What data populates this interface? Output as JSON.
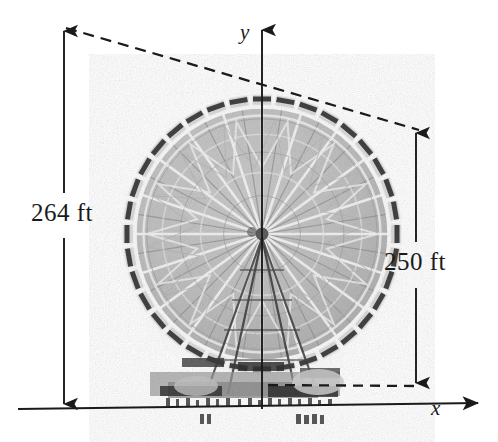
{
  "figure": {
    "kind": "ferris-wheel-dimension-diagram",
    "background_color": "#ffffff",
    "ink_color": "#1a1a1a"
  },
  "axes": {
    "y_label": "y",
    "x_label": "x",
    "y_axis": {
      "x": 262,
      "y_top": 27,
      "y_bottom": 409
    },
    "x_axis": {
      "x_left": 18,
      "x_right": 486,
      "y_left": 409,
      "y_bottom_right": 403
    }
  },
  "dimensions": [
    {
      "id": "overall-height",
      "label": "264 ft",
      "value": 264,
      "unit": "ft",
      "orientation": "vertical",
      "style": "double-headed-arrow",
      "x": 64,
      "y_top": 28,
      "y_bottom": 407
    },
    {
      "id": "wheel-diameter",
      "label": "250 ft",
      "value": 250,
      "unit": "ft",
      "orientation": "vertical",
      "style": "double-headed-arrow",
      "x": 416,
      "y_top": 130,
      "y_bottom": 386
    }
  ],
  "leader_lines": [
    {
      "id": "top-leader",
      "style": "dashed",
      "from": [
        66,
        28
      ],
      "to": [
        419,
        130
      ]
    },
    {
      "id": "bottom-leader",
      "style": "dashed",
      "from": [
        268,
        385
      ],
      "to": [
        417,
        386
      ]
    }
  ],
  "wheel": {
    "hub": [
      262,
      234
    ],
    "rim_radius": 128,
    "inner_radius": 112,
    "spoke_count": 40,
    "gondola_count": 36,
    "tone": "grayscale-photograph"
  }
}
